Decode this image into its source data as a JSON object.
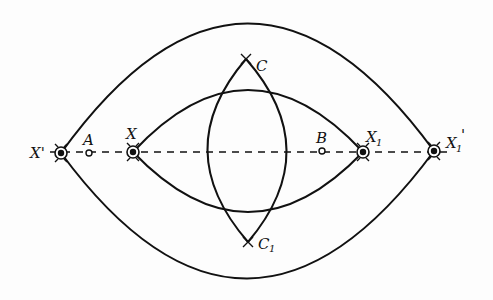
{
  "diagram": {
    "type": "geometric-construction",
    "colors": {
      "stroke": "#111111",
      "background": "#fdfdfd"
    },
    "axis": {
      "style": "dashed",
      "y": 152,
      "x_start": 50,
      "x_end": 448
    },
    "points": [
      {
        "id": "X_prime",
        "label": "X'",
        "x": 61,
        "y": 153,
        "marker": "bullseye-with-arcs"
      },
      {
        "id": "A",
        "label": "A",
        "x": 89,
        "y": 153,
        "marker": "open-circle"
      },
      {
        "id": "X",
        "label": "X",
        "x": 133,
        "y": 152,
        "marker": "bullseye-with-arcs"
      },
      {
        "id": "B",
        "label": "B",
        "x": 322,
        "y": 151,
        "marker": "open-circle"
      },
      {
        "id": "X1",
        "label": "X",
        "subscript": "1",
        "x": 363,
        "y": 152,
        "marker": "bullseye-with-arcs"
      },
      {
        "id": "X1_prime",
        "label": "X",
        "subscript": "1",
        "prime": "'",
        "x": 434,
        "y": 151,
        "marker": "bullseye-with-arcs"
      },
      {
        "id": "C",
        "label": "C",
        "x": 246,
        "y": 59,
        "marker": "arc-intersection"
      },
      {
        "id": "C1",
        "label": "C",
        "subscript": "1",
        "x": 248,
        "y": 242,
        "marker": "arc-intersection"
      }
    ],
    "curves": [
      {
        "id": "outer-lens-top",
        "from": "X_prime",
        "to": "X1_prime",
        "apex_y": 24
      },
      {
        "id": "outer-lens-bottom",
        "from": "X_prime",
        "to": "X1_prime",
        "apex_y": 279
      },
      {
        "id": "inner-lens-top",
        "from": "X",
        "to": "X1",
        "apex_y": 90
      },
      {
        "id": "inner-lens-bottom",
        "from": "X",
        "to": "X1",
        "apex_y": 212
      },
      {
        "id": "vertical-lens-left",
        "from": "C",
        "to": "C1",
        "apex_x": 207
      },
      {
        "id": "vertical-lens-right",
        "from": "C",
        "to": "C1",
        "apex_x": 287
      }
    ]
  }
}
